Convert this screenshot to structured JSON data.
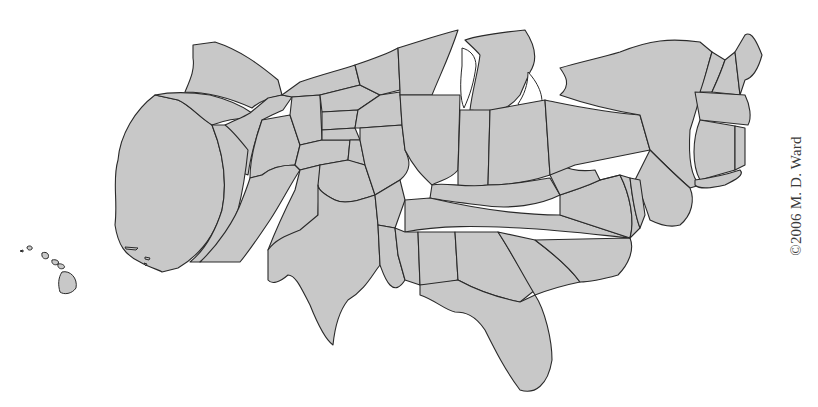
{
  "map": {
    "title": "United States population cartogram",
    "type": "cartogram",
    "colors": {
      "fill": "#c8c8c8",
      "stroke": "#2a2a2a",
      "background": "#ffffff",
      "text": "#3a3a3a"
    },
    "regions": [
      "Washington",
      "Oregon",
      "California",
      "Idaho",
      "Nevada",
      "Montana",
      "Wyoming",
      "Utah",
      "Arizona",
      "Colorado",
      "New Mexico",
      "North Dakota",
      "South Dakota",
      "Nebraska",
      "Kansas",
      "Oklahoma",
      "Texas",
      "Minnesota",
      "Iowa",
      "Missouri",
      "Arkansas",
      "Louisiana",
      "Wisconsin",
      "Illinois",
      "Michigan",
      "Indiana",
      "Ohio",
      "Kentucky",
      "Tennessee",
      "Mississippi",
      "Alabama",
      "Georgia",
      "Florida",
      "South Carolina",
      "North Carolina",
      "Virginia",
      "West Virginia",
      "Pennsylvania",
      "New York",
      "Vermont",
      "New Hampshire",
      "Maine",
      "Massachusetts",
      "Connecticut",
      "Rhode Island",
      "New Jersey",
      "Delaware",
      "Maryland",
      "Hawaii"
    ]
  },
  "copyright": "©2006 M. D. Ward"
}
